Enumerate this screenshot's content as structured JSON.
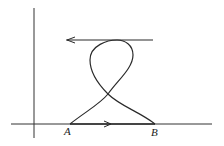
{
  "diagram": {
    "type": "path-on-axes",
    "colors": {
      "stroke": "#2a2a2a",
      "axis": "#333333",
      "background": "#ffffff"
    },
    "axes": {
      "origin": [
        34,
        124
      ],
      "x_axis_span": [
        11,
        212
      ],
      "y_axis_span": [
        8,
        138
      ]
    },
    "points": [
      {
        "label": "A",
        "x": 70,
        "y": 124
      },
      {
        "label": "B",
        "x": 155,
        "y": 124
      }
    ],
    "segments": [
      {
        "name": "bottom-segment-AB",
        "from": "A",
        "to": "B",
        "arrow_direction": "right"
      },
      {
        "name": "top-horizontal-line",
        "y": 40,
        "x_from": 153,
        "x_to": 66,
        "arrow_direction": "left"
      },
      {
        "name": "figure-eight-loop",
        "from": "A",
        "to": "B",
        "crossing": [
          108,
          94
        ]
      }
    ],
    "labels": {
      "A": "A",
      "B": "B"
    }
  }
}
